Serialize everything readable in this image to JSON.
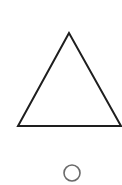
{
  "canvas": {
    "width": 122,
    "height": 185,
    "background": "#ffffff"
  },
  "shapes": {
    "triangle": {
      "type": "triangle",
      "points": "69,33 18,126 121,126",
      "stroke": "#1e1e1e",
      "stroke_width": "2",
      "fill": "#ffffff"
    },
    "circle": {
      "type": "circle",
      "cx": "72",
      "cy": "173",
      "r": "8",
      "stroke": "#6a6a6a",
      "stroke_width": "1.6",
      "fill": "none"
    }
  }
}
